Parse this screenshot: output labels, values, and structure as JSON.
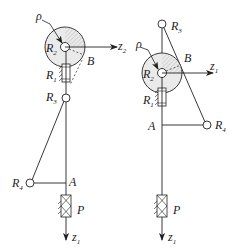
{
  "figures": [
    {
      "id": "left",
      "labels": {
        "rho": "ρ",
        "R2": "R",
        "R2_sub": "2",
        "z_axis": "z",
        "z_axis_sub": "2",
        "B": "B",
        "R1": "R",
        "R1_sub": "1",
        "R3": "R",
        "R3_sub": "3",
        "R4": "R",
        "R4_sub": "4",
        "A": "A",
        "P": "P",
        "z1": "z",
        "z1_sub": "1"
      }
    },
    {
      "id": "right",
      "labels": {
        "R3": "R",
        "R3_sub": "3",
        "rho": "ρ",
        "R2": "R",
        "R2_sub": "2",
        "B": "B",
        "z_axis": "z",
        "z_axis_sub": "1",
        "R1": "R",
        "R1_sub": "1",
        "A": "A",
        "R4": "R",
        "R4_sub": "4",
        "P": "P",
        "z1": "z",
        "z1_sub": "1"
      }
    }
  ],
  "colors": {
    "line": "#222222",
    "disc_fill": "#e6e6e6",
    "hatch": "#999999"
  }
}
